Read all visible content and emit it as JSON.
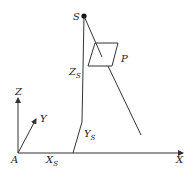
{
  "diagram": {
    "type": "photogrammetry-geometry",
    "labels": {
      "S": "S",
      "P": "P",
      "Zs_main": "Z",
      "Zs_sub": "S",
      "Ys_main": "Y",
      "Ys_sub": "S",
      "Xs_main": "X",
      "Xs_sub": "S",
      "Z": "Z",
      "Y": "Y",
      "X": "X",
      "A": "A"
    },
    "colors": {
      "stroke": "#333333",
      "text": "#222222",
      "background": "#ffffff"
    }
  }
}
